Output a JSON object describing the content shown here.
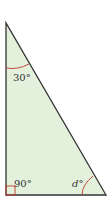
{
  "diagram": {
    "type": "right triangle",
    "fill_color": "#e3f0dc",
    "stroke_color": "#333333",
    "arc_color": "#c0392b",
    "angles": {
      "top": "30°",
      "bottom_left": "90°",
      "bottom_right": "d°"
    }
  }
}
